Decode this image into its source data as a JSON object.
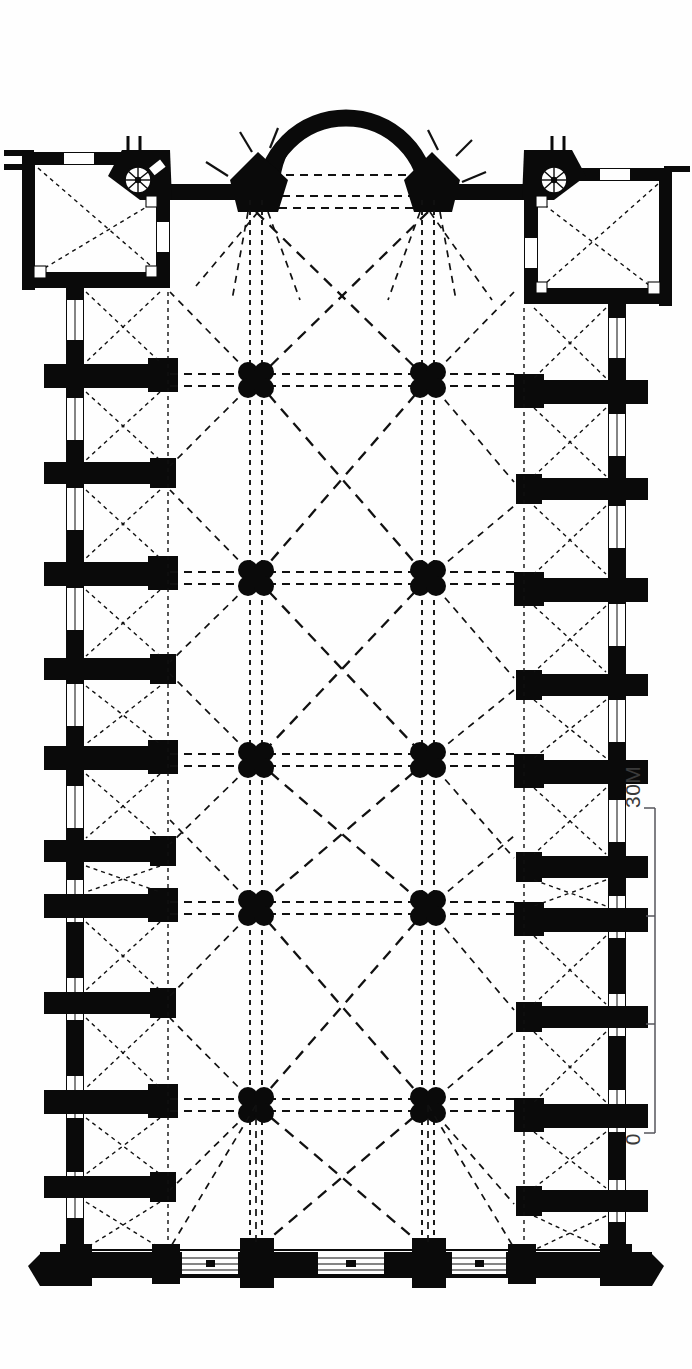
{
  "document": {
    "kind": "architectural-floor-plan",
    "subject": "Gothic church plan — nave, aisles, transept chapels, apse",
    "orientation": "rotated 90 degrees; apse at top, west facade at bottom",
    "ink_color": "#0a0a0a",
    "paper_color": "#fefefe"
  },
  "scale_bar": {
    "top_label": "30M",
    "bottom_label": "0",
    "units": "M",
    "max_value": 30,
    "tick_values": [
      0,
      10,
      20,
      30
    ],
    "orientation": "vertical",
    "line_color": "#55555b"
  },
  "legend_elements": {
    "solid_black": "masonry wall / pier cut",
    "dashed_lines": "vault rib projection overhead",
    "white_slots": "window and door openings",
    "spoked_circle": "spiral staircase"
  },
  "plan": {
    "nave": {
      "label": "nave",
      "bay_count": 6,
      "pier_columns_x": [
        256,
        428
      ],
      "pier_rows_y": [
        380,
        578,
        760,
        908,
        1105
      ],
      "pier_shape": "quatrefoil-clustered"
    },
    "aisles": {
      "left_label": "north aisle",
      "right_label": "south aisle",
      "buttress_count_per_side": 10,
      "window_count_per_side": 9
    },
    "apse": {
      "label": "apse",
      "shape": "semicircular",
      "wall_thickness_px": 17
    },
    "transept_chapels": [
      {
        "label": "left chapel",
        "has_spiral_stair": true
      },
      {
        "label": "right chapel",
        "has_spiral_stair": true
      }
    ],
    "west_facade": {
      "label": "west facade",
      "portal_count": 3
    },
    "crossing_piers": {
      "label": "diamond crossing piers",
      "count": 2,
      "shape": "diamond"
    }
  }
}
